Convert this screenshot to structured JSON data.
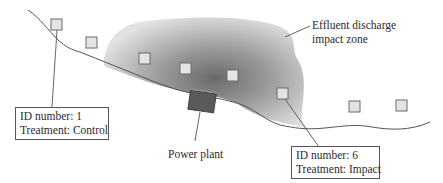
{
  "diagram": {
    "zone_label": {
      "line1": "Effluent discharge",
      "line2": "impact zone"
    },
    "power_plant_label": "Power plant",
    "callouts": [
      {
        "id_text": "ID number: 1",
        "treatment_text": "Treatment: Control"
      },
      {
        "id_text": "ID number: 6",
        "treatment_text": "Treatment: Impact"
      }
    ],
    "sample_sites": [
      {
        "x": 56,
        "y": 24
      },
      {
        "x": 91,
        "y": 42
      },
      {
        "x": 144,
        "y": 58
      },
      {
        "x": 184,
        "y": 69
      },
      {
        "x": 232,
        "y": 75
      },
      {
        "x": 282,
        "y": 93
      },
      {
        "x": 354,
        "y": 106
      },
      {
        "x": 401,
        "y": 105
      }
    ],
    "colors": {
      "coastline": "#555555",
      "zone_dark": "#6e6e6e",
      "zone_light": "#e6e6e6",
      "site_fill": "#e4e4e4",
      "site_stroke": "#6a6a6a",
      "power_plant": "#5a5a5a"
    }
  }
}
